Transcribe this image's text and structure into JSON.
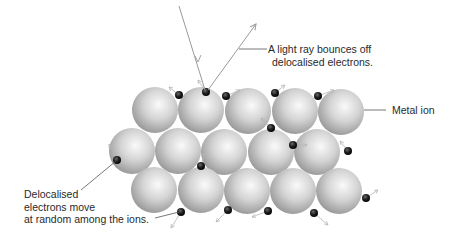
{
  "diagram": {
    "labels": {
      "light_ray": [
        "A light ray bounces off",
        "delocalised electrons."
      ],
      "metal_ion": "Metal ion",
      "electrons": [
        "Delocalised",
        "electrons move",
        "at random among the ions."
      ]
    },
    "colors": {
      "ion_light": "#f4f4f4",
      "ion_dark": "#8c8c8c",
      "electron": "#1e1e1e",
      "arrow": "#b5b5b5",
      "leader": "#555555",
      "ray": "#9a9a9a"
    },
    "ion_radius": 23,
    "ions": [
      {
        "row": 1,
        "x": 155,
        "y": 110
      },
      {
        "row": 1,
        "x": 201,
        "y": 110
      },
      {
        "row": 1,
        "x": 248,
        "y": 111
      },
      {
        "row": 1,
        "x": 295,
        "y": 111
      },
      {
        "row": 1,
        "x": 341,
        "y": 112
      },
      {
        "row": 2,
        "x": 132,
        "y": 151
      },
      {
        "row": 2,
        "x": 178,
        "y": 151
      },
      {
        "row": 2,
        "x": 224,
        "y": 152
      },
      {
        "row": 2,
        "x": 271,
        "y": 152
      },
      {
        "row": 2,
        "x": 317,
        "y": 152
      },
      {
        "row": 3,
        "x": 154,
        "y": 190
      },
      {
        "row": 3,
        "x": 201,
        "y": 190
      },
      {
        "row": 3,
        "x": 247,
        "y": 191
      },
      {
        "row": 3,
        "x": 293,
        "y": 191
      },
      {
        "row": 3,
        "x": 339,
        "y": 191
      }
    ],
    "electrons": [
      {
        "x": 179,
        "y": 95,
        "dx": -10,
        "dy": -8
      },
      {
        "x": 206,
        "y": 92,
        "dx": -8,
        "dy": -12
      },
      {
        "x": 226,
        "y": 96,
        "dx": 14,
        "dy": -6
      },
      {
        "x": 275,
        "y": 93,
        "dx": 10,
        "dy": -8
      },
      {
        "x": 318,
        "y": 96,
        "dx": 16,
        "dy": -6
      },
      {
        "x": 271,
        "y": 128,
        "dx": -10,
        "dy": -10
      },
      {
        "x": 293,
        "y": 145,
        "dx": 14,
        "dy": 0
      },
      {
        "x": 348,
        "y": 151,
        "dx": -8,
        "dy": -10
      },
      {
        "x": 117,
        "y": 160,
        "dx": -8,
        "dy": -16
      },
      {
        "x": 201,
        "y": 166,
        "dx": 4,
        "dy": -14
      },
      {
        "x": 366,
        "y": 198,
        "dx": 12,
        "dy": -8
      },
      {
        "x": 181,
        "y": 212,
        "dx": -10,
        "dy": 16
      },
      {
        "x": 228,
        "y": 210,
        "dx": -12,
        "dy": 12
      },
      {
        "x": 268,
        "y": 211,
        "dx": -16,
        "dy": 6
      },
      {
        "x": 314,
        "y": 213,
        "dx": 14,
        "dy": 12
      }
    ]
  }
}
